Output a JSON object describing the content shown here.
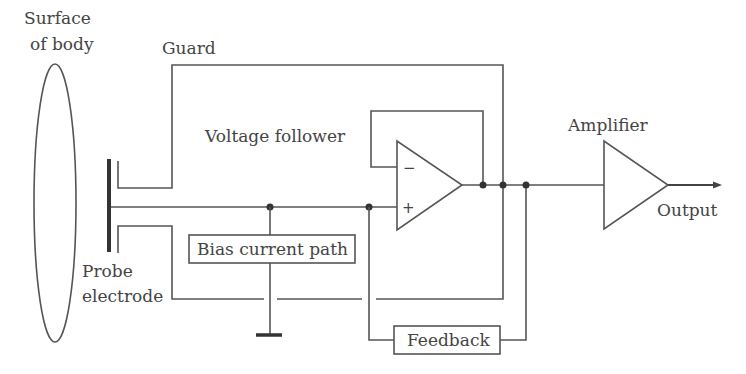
{
  "diagram": {
    "type": "circuit-schematic",
    "colors": {
      "stroke": "#555555",
      "text": "#444444",
      "electrode": "#333333",
      "background": "#ffffff"
    },
    "labels": {
      "surface_line1": "Surface",
      "surface_line2": "of body",
      "guard": "Guard",
      "voltage_follower": "Voltage follower",
      "amplifier": "Amplifier",
      "output": "Output",
      "probe_line1": "Probe",
      "probe_line2": "electrode",
      "bias_current_path": "Bias current path",
      "feedback": "Feedback",
      "minus_sign": "−",
      "plus_sign": "+"
    },
    "components": [
      "surface-of-body-ellipse",
      "probe-electrode",
      "guard-upper",
      "guard-lower",
      "voltage-follower-opamp",
      "bias-current-path-box",
      "ground-symbol",
      "feedback-box",
      "amplifier",
      "output-arrow"
    ]
  }
}
